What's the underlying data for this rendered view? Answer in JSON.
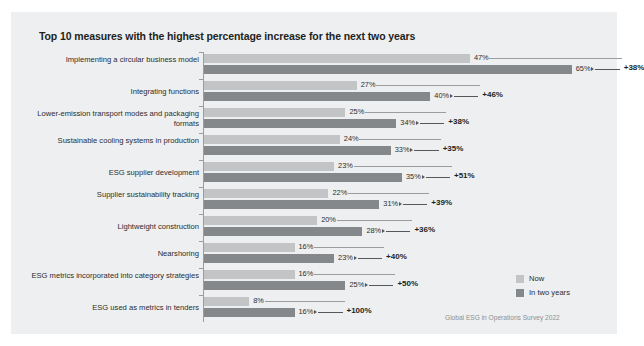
{
  "chart_data": {
    "type": "bar",
    "orientation": "horizontal",
    "title": "Top 10 measures with the highest percentage increase for the next two years",
    "xlabel": "",
    "ylabel": "",
    "xlim": [
      0,
      70
    ],
    "grid": false,
    "legend_position": "right-bottom",
    "value_suffix": "%",
    "categories": [
      "Implementing a circular business model",
      "Integrating functions",
      "Lower-emission transport modes and packaging formats",
      "Sustainable cooling systems in production",
      "ESG supplier development",
      "Supplier sustainability tracking",
      "Lightweight construction",
      "Nearshoring",
      "ESG metrics incorporated into category strategies",
      "ESG used as metrics in tenders"
    ],
    "series": [
      {
        "name": "Now",
        "color": "#c2c4c6",
        "values": [
          47,
          27,
          25,
          24,
          23,
          22,
          20,
          16,
          16,
          8
        ],
        "labels": [
          "47%",
          "27%",
          "25%",
          "24%",
          "23%",
          "22%",
          "20%",
          "16%",
          "16%",
          "8%"
        ]
      },
      {
        "name": "In two years",
        "color": "#85888b",
        "values": [
          65,
          40,
          34,
          33,
          35,
          31,
          28,
          23,
          25,
          16
        ],
        "labels": [
          "65%",
          "40%",
          "34%",
          "33%",
          "35%",
          "31%",
          "28%",
          "23%",
          "25%",
          "16%"
        ]
      }
    ],
    "annotations": {
      "label": "relative increase",
      "values": [
        38,
        46,
        38,
        35,
        51,
        39,
        36,
        40,
        50,
        100
      ],
      "labels": [
        "+38%",
        "+46%",
        "+38%",
        "+35%",
        "+51%",
        "+39%",
        "+36%",
        "+40%",
        "+50%",
        "+100%"
      ]
    },
    "source": "Global ESG in Operations Survey 2022"
  },
  "legend": {
    "items": [
      {
        "label": "Now",
        "swatch": "now"
      },
      {
        "label": "In two years",
        "swatch": "future"
      }
    ]
  }
}
